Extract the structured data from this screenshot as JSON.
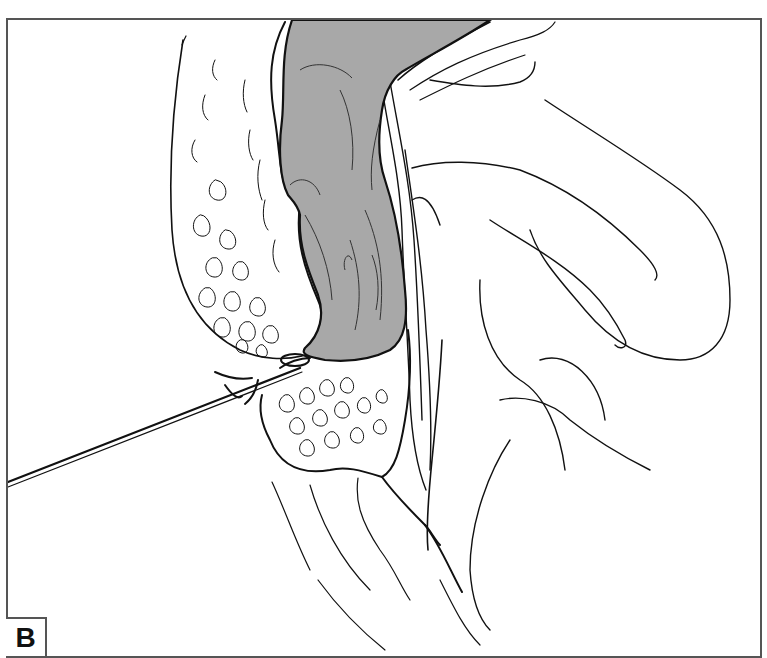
{
  "figure": {
    "panel_label": "B",
    "colors": {
      "line": "#111111",
      "frame": "#555555",
      "organ_fill": "#a8a8a8",
      "background": "#ffffff"
    },
    "elements": [
      {
        "name": "gray-organ",
        "label": ""
      },
      {
        "name": "fatty-tissue-upper",
        "label": ""
      },
      {
        "name": "fatty-tissue-lower",
        "label": ""
      },
      {
        "name": "needle",
        "label": ""
      },
      {
        "name": "folded-tissue-right",
        "label": ""
      }
    ]
  }
}
